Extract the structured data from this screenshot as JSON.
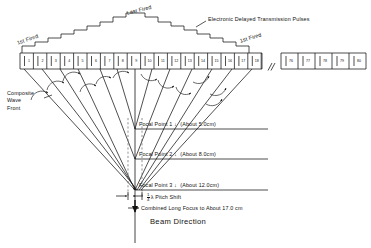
{
  "figure": {
    "type": "diagram"
  },
  "labels": {
    "first_fired_left": "1st Fired",
    "last_fired": "Last Fired",
    "first_fired_right": "1st Fired",
    "pulses": "Electronic Delayed Transmission Pulses",
    "composite_wave_front": [
      "Composite",
      "Wave",
      "Front"
    ],
    "beam_direction": "Beam Direction",
    "combined_focus": "Combined Long Focus to About 17.0 cm",
    "pitch_shift_prefix": "",
    "pitch_shift_num": "1",
    "pitch_shift_den": "4",
    "pitch_shift_suffix": "λ Pitch Shift"
  },
  "focal_points": [
    {
      "name": "Focal Point 1",
      "arrow": "↓",
      "distance": "(About 5.0cm)"
    },
    {
      "name": "Focal Point 2",
      "arrow": "↓",
      "distance": "(About 8.0cm)"
    },
    {
      "name": "Focal Point 3",
      "arrow": "↓",
      "distance": "(About 12.0cm)"
    }
  ],
  "array": {
    "element_numbers_left": [
      "1",
      "2",
      "3",
      "4",
      "5",
      "6",
      "7",
      "8",
      "9",
      "10",
      "11",
      "12",
      "13",
      "14",
      "15",
      "16",
      "17",
      "18"
    ],
    "break_marker": "//",
    "element_numbers_right": [
      "76",
      "77",
      "78",
      "79",
      "80"
    ],
    "total_elements": 80
  },
  "colors": {
    "ink": "#111111",
    "line": "#1a1a1a",
    "dashed": "#555555",
    "background": "#ffffff"
  }
}
